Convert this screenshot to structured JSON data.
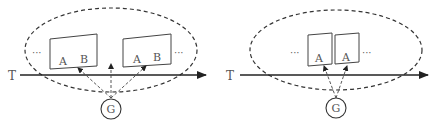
{
  "diagram": {
    "stroke_color": "#333333",
    "label_color": "#555555",
    "panels": [
      {
        "id": "left",
        "axis_label": "T",
        "node_label": "G",
        "cards": [
          {
            "labels": [
              "A",
              "B"
            ]
          },
          {
            "labels": [
              "A",
              "B"
            ]
          }
        ],
        "ellipsis_left": "···",
        "ellipsis_right": "···"
      },
      {
        "id": "right",
        "axis_label": "T",
        "node_label": "G",
        "cards": [
          {
            "labels": [
              "A"
            ]
          },
          {
            "labels": [
              "A"
            ]
          }
        ],
        "ellipsis_left": "···",
        "ellipsis_right": "···"
      }
    ]
  }
}
